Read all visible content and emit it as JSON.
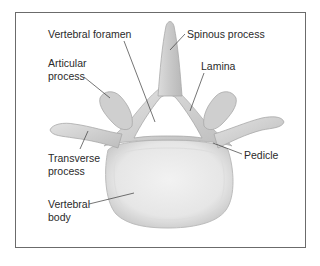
{
  "diagram": {
    "labels": {
      "vertebral_foramen": "Vertebral foramen",
      "spinous_process": "Spinous process",
      "articular_process_1": "Articular",
      "articular_process_2": "process",
      "lamina": "Lamina",
      "transverse_process_1": "Transverse",
      "transverse_process_2": "process",
      "pedicle": "Pedicle",
      "vertebral_body_1": "Vertebral",
      "vertebral_body_2": "body"
    },
    "colors": {
      "border": "#6b6b6b",
      "bone_light": "#ececec",
      "bone_mid": "#d2d2d2",
      "bone_dark": "#b4b4b4",
      "leader_line": "#3a3a3a",
      "text": "#2a2a2a"
    }
  }
}
